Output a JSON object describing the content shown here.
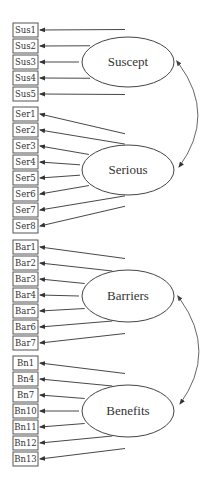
{
  "diagram": {
    "type": "structural-equation-model",
    "colors": {
      "stroke": "#444444",
      "text": "#333333",
      "background": "#ffffff"
    },
    "factors": [
      {
        "id": "suscept",
        "label": "Suscept",
        "cx": 128,
        "cy": 62,
        "rx": 46,
        "ry": 25,
        "indicators": [
          {
            "label": "Sus1",
            "y": 23
          },
          {
            "label": "Sus2",
            "y": 39
          },
          {
            "label": "Sus3",
            "y": 55
          },
          {
            "label": "Sus4",
            "y": 71
          },
          {
            "label": "Sus5",
            "y": 87
          }
        ]
      },
      {
        "id": "serious",
        "label": "Serious",
        "cx": 128,
        "cy": 170,
        "rx": 46,
        "ry": 25,
        "indicators": [
          {
            "label": "Ser1",
            "y": 107
          },
          {
            "label": "Ser2",
            "y": 123
          },
          {
            "label": "Ser3",
            "y": 139
          },
          {
            "label": "Ser4",
            "y": 155
          },
          {
            "label": "Ser5",
            "y": 171
          },
          {
            "label": "Ser6",
            "y": 187
          },
          {
            "label": "Ser7",
            "y": 203
          },
          {
            "label": "Ser8",
            "y": 219
          }
        ]
      },
      {
        "id": "barriers",
        "label": "Barriers",
        "cx": 128,
        "cy": 296,
        "rx": 46,
        "ry": 26,
        "indicators": [
          {
            "label": "Bar1",
            "y": 240
          },
          {
            "label": "Bar2",
            "y": 256
          },
          {
            "label": "Bar3",
            "y": 272
          },
          {
            "label": "Bar4",
            "y": 288
          },
          {
            "label": "Bar5",
            "y": 304
          },
          {
            "label": "Bar6",
            "y": 320
          },
          {
            "label": "Bar7",
            "y": 336
          }
        ]
      },
      {
        "id": "benefits",
        "label": "Benefits",
        "cx": 128,
        "cy": 411,
        "rx": 46,
        "ry": 26,
        "indicators": [
          {
            "label": "Bn1",
            "y": 356
          },
          {
            "label": "Bn4",
            "y": 372
          },
          {
            "label": "Bn7",
            "y": 388
          },
          {
            "label": "Bn10",
            "y": 404
          },
          {
            "label": "Bn11",
            "y": 420
          },
          {
            "label": "Bn12",
            "y": 436
          },
          {
            "label": "Bn13",
            "y": 452
          }
        ]
      }
    ],
    "covariances": [
      {
        "from": "suscept",
        "to": "serious",
        "x1": 179,
        "y1": 64,
        "x2": 179,
        "y2": 167,
        "bulge_x": 207
      },
      {
        "from": "barriers",
        "to": "benefits",
        "x1": 180,
        "y1": 299,
        "x2": 180,
        "y2": 404,
        "bulge_x": 208
      }
    ],
    "box": {
      "x": 13,
      "width": 25,
      "height": 14
    }
  }
}
